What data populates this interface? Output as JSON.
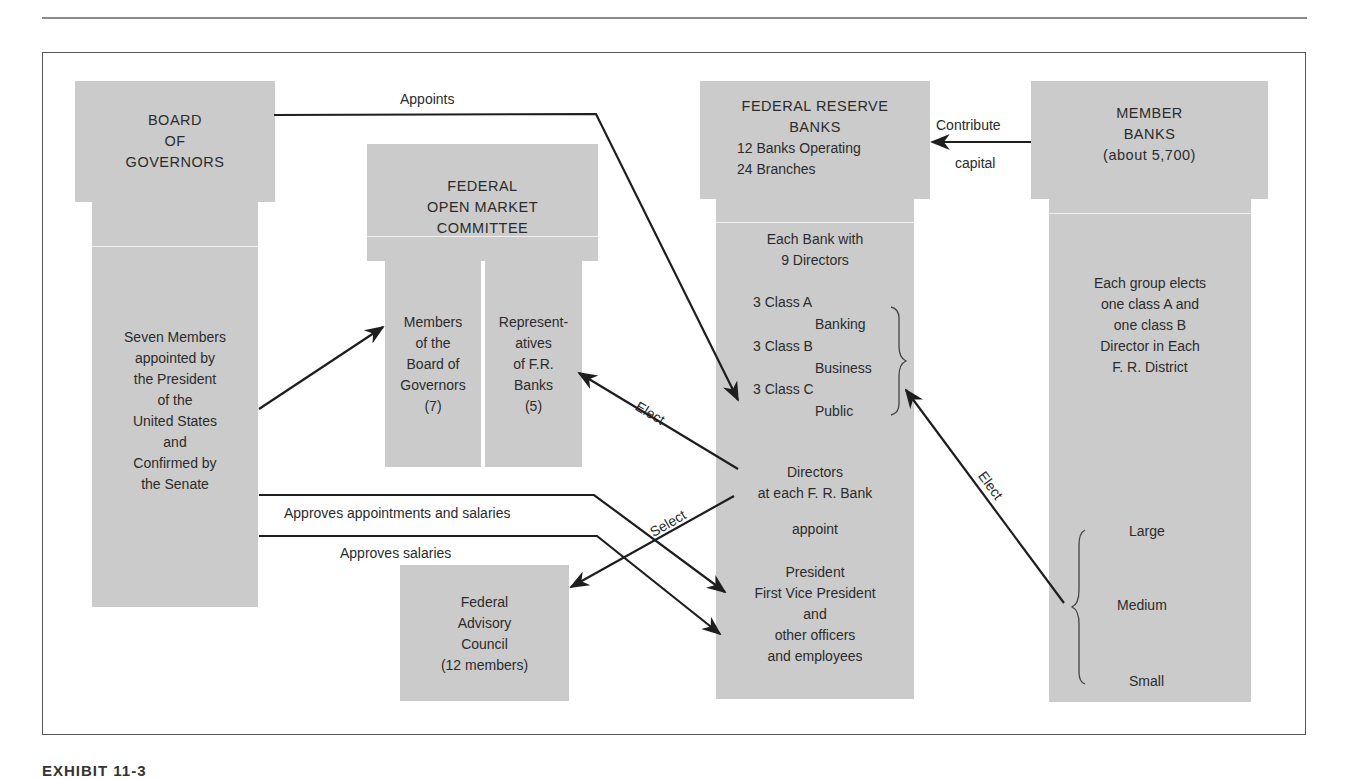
{
  "diagram": {
    "board": {
      "title": "BOARD\nOF\nGOVERNORS",
      "body": "Seven Members\nappointed by\nthe President\nof the\nUnited States\nand\nConfirmed by\nthe Senate"
    },
    "fomc": {
      "title": "FEDERAL\nOPEN MARKET\nCOMMITTEE",
      "left_column": "Members\nof the\nBoard of\nGovernors\n(7)",
      "right_column": "Represent-\natives\nof F.R.\nBanks\n(5)"
    },
    "federal_reserve_banks": {
      "title": "FEDERAL RESERVE\nBANKS",
      "subtitle": "12 Banks Operating\n24 Branches",
      "directors_heading": "Each Bank with\n9 Directors",
      "classes": [
        {
          "class": "3 Class A",
          "type": "Banking"
        },
        {
          "class": "3 Class B",
          "type": "Business"
        },
        {
          "class": "3 Class C",
          "type": "Public"
        }
      ],
      "directors_label": "Directors\nat each F. R. Bank",
      "appoint_label": "appoint",
      "officers": "President\nFirst Vice President\nand\nother officers\nand employees"
    },
    "member_banks": {
      "title": "MEMBER\nBANKS\n(about 5,700)",
      "body": "Each group elects\none class A and\none class B\nDirector in Each\nF. R. District",
      "sizes": [
        "Large",
        "Medium",
        "Small"
      ]
    },
    "advisory_council": {
      "body": "Federal\nAdvisory\nCouncil\n(12 members)"
    },
    "edges": {
      "appoints": "Appoints",
      "contribute": "Contribute",
      "capital": "capital",
      "elect_fomc": "Elect",
      "elect_directors": "Elect",
      "select": "Select",
      "approves_appointments": "Approves appointments and salaries",
      "approves_salaries": "Approves salaries"
    }
  },
  "caption": "EXHIBIT 11-3",
  "colors": {
    "box_fill": "#cbcbcb",
    "text": "#2b2b2b",
    "line": "#1e1e1e"
  }
}
